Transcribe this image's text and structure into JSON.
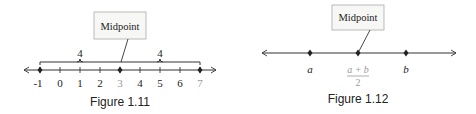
{
  "figures": [
    {
      "caption": "Figure 1.11",
      "callout": "Midpoint",
      "ticks": [
        "-1",
        "0",
        "1",
        "2",
        "3",
        "4",
        "5",
        "6",
        "7"
      ],
      "points": [
        "-1",
        "3",
        "7"
      ],
      "distances": [
        "4",
        "4"
      ],
      "midpoint_label": "3"
    },
    {
      "caption": "Figure 1.12",
      "callout": "Midpoint",
      "points": [
        {
          "label": "a"
        },
        {
          "label_num": "a + b",
          "label_den": "2"
        },
        {
          "label": "b"
        }
      ]
    }
  ],
  "colors": {
    "line": "#333333",
    "text": "#222222",
    "midpoint_label": "#9a9a9a",
    "callout_bg": "#f7f7f5",
    "callout_border": "#999999"
  }
}
